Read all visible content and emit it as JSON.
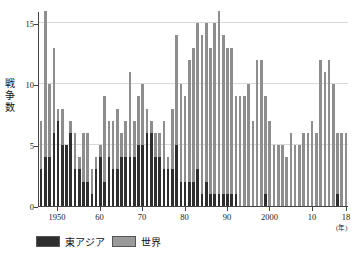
{
  "chart_data": {
    "type": "bar",
    "title": "",
    "subtitle": "",
    "xlabel": "年",
    "ylabel": "戦争数",
    "stacked": true,
    "grid": true,
    "legend_position": "bottom-left",
    "ylim": [
      0,
      16
    ],
    "yticks": [
      0,
      5,
      10,
      15
    ],
    "ytick_labels": [
      "0",
      "5",
      "10",
      "15"
    ],
    "xtick_years": [
      1950,
      1960,
      1970,
      1980,
      1990,
      2000,
      2010,
      2018
    ],
    "xtick_labels": [
      "1950",
      "60",
      "70",
      "80",
      "90",
      "2000",
      "10",
      "18"
    ],
    "x_unit_label": "(年)",
    "colors": {
      "east_asia": "#2e2e2e",
      "world": "#8e8e8e",
      "grid": "#d8d8d8",
      "axis": "#444444",
      "background": "#ffffff"
    },
    "categories": [
      1946,
      1947,
      1948,
      1949,
      1950,
      1951,
      1952,
      1953,
      1954,
      1955,
      1956,
      1957,
      1958,
      1959,
      1960,
      1961,
      1962,
      1963,
      1964,
      1965,
      1966,
      1967,
      1968,
      1969,
      1970,
      1971,
      1972,
      1973,
      1974,
      1975,
      1976,
      1977,
      1978,
      1979,
      1980,
      1981,
      1982,
      1983,
      1984,
      1985,
      1986,
      1987,
      1988,
      1989,
      1990,
      1991,
      1992,
      1993,
      1994,
      1995,
      1996,
      1997,
      1998,
      1999,
      2000,
      2001,
      2002,
      2003,
      2004,
      2005,
      2006,
      2007,
      2008,
      2009,
      2010,
      2011,
      2012,
      2013,
      2014,
      2015,
      2016,
      2017,
      2018
    ],
    "series": [
      {
        "name": "東アジア",
        "key": "east_asia",
        "color": "#2e2e2e",
        "values": [
          3,
          4,
          4,
          6,
          7,
          5,
          5,
          6,
          3,
          3,
          2,
          2,
          1,
          3,
          4,
          2,
          4,
          3,
          3,
          4,
          4,
          4,
          4,
          5,
          5,
          6,
          6,
          4,
          4,
          3,
          3,
          3,
          5,
          2,
          2,
          2,
          2,
          3,
          1,
          2,
          1,
          1,
          1,
          1,
          1,
          1,
          1,
          0,
          0,
          0,
          0,
          0,
          0,
          1,
          0,
          0,
          0,
          0,
          0,
          0,
          0,
          0,
          0,
          0,
          0,
          0,
          0,
          0,
          0,
          0,
          1,
          0,
          0
        ]
      },
      {
        "name": "世界",
        "key": "world",
        "color": "#8e8e8e",
        "values": [
          7,
          16,
          10,
          13,
          8,
          8,
          5,
          7,
          6,
          4,
          6,
          6,
          3,
          4,
          5,
          9,
          7,
          7,
          8,
          6,
          7,
          11,
          7,
          9,
          10,
          8,
          7,
          6,
          6,
          7,
          4,
          8,
          14,
          10,
          9,
          12,
          13,
          15,
          14,
          15,
          13,
          15,
          16,
          14,
          13,
          13,
          9,
          9,
          9,
          10,
          7,
          12,
          12,
          9,
          7,
          5,
          5,
          5,
          4,
          6,
          5,
          5,
          6,
          6,
          7,
          6,
          12,
          11,
          12,
          10,
          6,
          6,
          6
        ]
      }
    ]
  },
  "legend": {
    "items": [
      {
        "label": "東アジア",
        "color": "#2e2e2e"
      },
      {
        "label": "世界",
        "color": "#9a9a9a"
      }
    ]
  },
  "axis": {
    "y_title": "戦争数",
    "x_unit": "(年)"
  }
}
